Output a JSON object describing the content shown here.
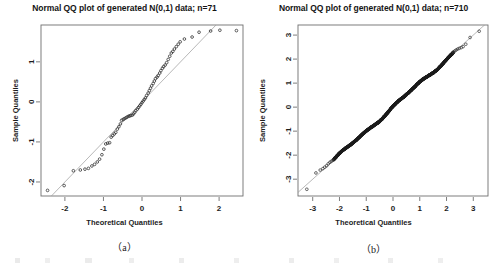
{
  "figure": {
    "caption_a": "（a）",
    "caption_b": "（b）"
  },
  "chart_data": [
    {
      "id": "qq-plot-a",
      "type": "scatter",
      "title": "Normal QQ plot of generated N(0,1) data; n=71",
      "xlabel": "Theoretical Quantiles",
      "ylabel": "Sample Quantiles",
      "caption": "（a）",
      "n": 71,
      "grid": false,
      "legend": "none",
      "point_marker": "open-circle",
      "reference_line": true,
      "xlim": [
        -2.62,
        2.62
      ],
      "ylim": [
        -2.35,
        1.92
      ],
      "xticks": [
        -2,
        -1,
        0,
        1,
        2
      ],
      "yticks": [
        -2,
        -1,
        0,
        1
      ],
      "xticklabels": [
        "-2",
        "-1",
        "0",
        "1",
        "2"
      ],
      "yticklabels": [
        "-2",
        "-1",
        "0",
        "1"
      ],
      "x": [
        -2.45,
        -2.02,
        -1.78,
        -1.6,
        -1.48,
        -1.39,
        -1.3,
        -1.23,
        -1.16,
        -1.1,
        -1.04,
        -0.99,
        -0.94,
        -0.89,
        -0.84,
        -0.8,
        -0.76,
        -0.72,
        -0.68,
        -0.64,
        -0.6,
        -0.56,
        -0.53,
        -0.49,
        -0.46,
        -0.42,
        -0.39,
        -0.35,
        -0.32,
        -0.29,
        -0.25,
        -0.22,
        -0.19,
        -0.16,
        -0.12,
        -0.09,
        -0.06,
        -0.03,
        0.0,
        0.03,
        0.06,
        0.09,
        0.12,
        0.16,
        0.19,
        0.22,
        0.25,
        0.29,
        0.32,
        0.35,
        0.39,
        0.42,
        0.46,
        0.49,
        0.53,
        0.56,
        0.6,
        0.64,
        0.68,
        0.72,
        0.76,
        0.8,
        0.84,
        0.89,
        0.94,
        0.99,
        1.1,
        1.3,
        1.48,
        1.78,
        2.02,
        2.45
      ],
      "y": [
        -2.21,
        -2.09,
        -1.72,
        -1.7,
        -1.68,
        -1.66,
        -1.6,
        -1.56,
        -1.5,
        -1.43,
        -1.32,
        -1.18,
        -1.05,
        -1.03,
        -1.02,
        -0.88,
        -0.84,
        -0.8,
        -0.76,
        -0.68,
        -0.62,
        -0.55,
        -0.46,
        -0.44,
        -0.42,
        -0.4,
        -0.38,
        -0.36,
        -0.35,
        -0.34,
        -0.33,
        -0.3,
        -0.26,
        -0.22,
        -0.18,
        -0.14,
        -0.1,
        -0.06,
        -0.02,
        0.02,
        0.06,
        0.1,
        0.16,
        0.22,
        0.28,
        0.34,
        0.4,
        0.46,
        0.52,
        0.58,
        0.62,
        0.66,
        0.72,
        0.78,
        0.84,
        0.88,
        0.92,
        0.98,
        1.06,
        1.14,
        1.22,
        1.26,
        1.32,
        1.38,
        1.44,
        1.5,
        1.57,
        1.62,
        1.74,
        1.77,
        1.79,
        1.78
      ]
    },
    {
      "id": "qq-plot-b",
      "type": "scatter",
      "title": "Normal QQ plot of generated N(0,1) data; n=710",
      "xlabel": "Theoretical Quantiles",
      "ylabel": "Sample Quantiles",
      "caption": "（b）",
      "n": 710,
      "grid": false,
      "legend": "none",
      "point_marker": "open-circle",
      "reference_line": true,
      "xlim": [
        -3.55,
        3.55
      ],
      "ylim": [
        -3.7,
        3.42
      ],
      "xticks": [
        -3,
        -2,
        -1,
        0,
        1,
        2,
        3
      ],
      "yticks": [
        -3,
        -2,
        -1,
        0,
        1,
        2,
        3
      ],
      "xticklabels": [
        "-3",
        "-2",
        "-1",
        "0",
        "1",
        "2",
        "3"
      ],
      "yticklabels": [
        "-3",
        "-2",
        "-1",
        "0",
        "1",
        "2",
        "3"
      ],
      "tail_points_low_x": [
        -3.22,
        -2.88,
        -2.72,
        -2.62,
        -2.55,
        -2.48,
        -2.42,
        -2.36,
        -2.31,
        -2.26
      ],
      "tail_points_low_y": [
        -3.42,
        -2.74,
        -2.62,
        -2.56,
        -2.5,
        -2.44,
        -2.36,
        -2.3,
        -2.26,
        -2.22
      ],
      "tail_points_high_x": [
        2.26,
        2.31,
        2.36,
        2.42,
        2.48,
        2.55,
        2.62,
        2.72,
        2.88,
        3.22
      ],
      "tail_points_high_y": [
        2.3,
        2.34,
        2.38,
        2.42,
        2.45,
        2.48,
        2.52,
        2.62,
        2.9,
        3.16
      ],
      "band_slope": 1.0,
      "band_intercept": 0.0
    }
  ]
}
